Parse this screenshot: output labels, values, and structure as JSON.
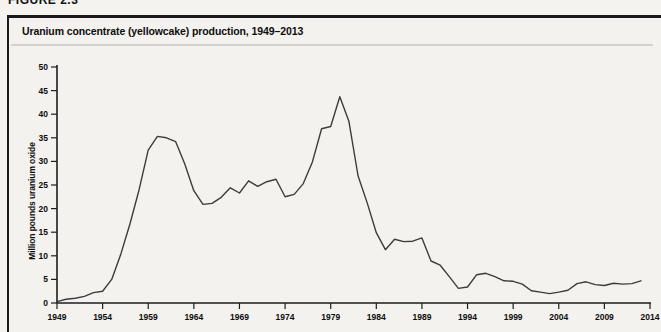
{
  "page": {
    "figure_label": "FIGURE 2.3"
  },
  "chart_data": {
    "type": "line",
    "title": "Uranium concentrate (yellowcake) production, 1949–2013",
    "xlabel": "",
    "ylabel": "Million pounds uranium oxide",
    "xlim": [
      1949,
      2014
    ],
    "ylim": [
      0,
      50
    ],
    "x_ticks": [
      1949,
      1954,
      1959,
      1964,
      1969,
      1974,
      1979,
      1984,
      1989,
      1994,
      1999,
      2004,
      2009,
      2014
    ],
    "y_ticks": [
      0,
      5,
      10,
      15,
      20,
      25,
      30,
      35,
      40,
      45,
      50
    ],
    "grid": false,
    "legend": "none",
    "line_color": "#3c3c3c",
    "axis_color": "#1c1c1c",
    "series": [
      {
        "name": "U.S. uranium concentrate production",
        "x": [
          1949,
          1950,
          1951,
          1952,
          1953,
          1954,
          1955,
          1956,
          1957,
          1958,
          1959,
          1960,
          1961,
          1962,
          1963,
          1964,
          1965,
          1966,
          1967,
          1968,
          1969,
          1970,
          1971,
          1972,
          1973,
          1974,
          1975,
          1976,
          1977,
          1978,
          1979,
          1980,
          1981,
          1982,
          1983,
          1984,
          1985,
          1986,
          1987,
          1988,
          1989,
          1990,
          1991,
          1992,
          1993,
          1994,
          1995,
          1996,
          1997,
          1998,
          1999,
          2000,
          2001,
          2002,
          2003,
          2004,
          2005,
          2006,
          2007,
          2008,
          2009,
          2010,
          2011,
          2012,
          2013
        ],
        "values": [
          0.3,
          0.8,
          1.0,
          1.4,
          2.2,
          2.5,
          5.0,
          10.4,
          16.8,
          24.0,
          32.4,
          35.3,
          35.0,
          34.2,
          29.5,
          23.8,
          20.9,
          21.1,
          22.4,
          24.4,
          23.3,
          25.9,
          24.7,
          25.7,
          26.2,
          22.5,
          23.0,
          25.3,
          29.9,
          36.9,
          37.4,
          43.7,
          38.5,
          26.9,
          21.2,
          14.9,
          11.3,
          13.5,
          13.0,
          13.1,
          13.8,
          8.9,
          8.0,
          5.6,
          3.1,
          3.4,
          6.0,
          6.3,
          5.6,
          4.7,
          4.6,
          4.0,
          2.6,
          2.3,
          2.0,
          2.3,
          2.7,
          4.1,
          4.5,
          3.9,
          3.7,
          4.2,
          4.0,
          4.1,
          4.7
        ]
      }
    ]
  }
}
